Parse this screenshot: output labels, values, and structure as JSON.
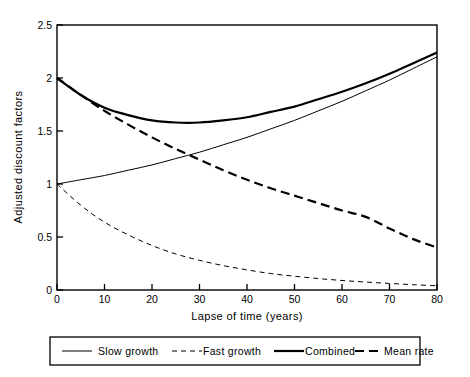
{
  "chart_data": {
    "type": "line",
    "title": "",
    "xlabel": "Lapse of time (years)",
    "ylabel": "Adjusted discount factors",
    "xlim": [
      0,
      80
    ],
    "ylim": [
      0,
      2.5
    ],
    "xticks": [
      0,
      10,
      20,
      30,
      40,
      50,
      60,
      70,
      80
    ],
    "xticklabels": [
      "0",
      "10",
      "20",
      "30",
      "40",
      "50",
      "60",
      "70",
      "80"
    ],
    "yticks": [
      0,
      0.5,
      1,
      1.5,
      2,
      2.5
    ],
    "yticklabels": [
      "0",
      "0.5",
      "1",
      "1.5",
      "2",
      "2.5"
    ],
    "grid": false,
    "legend_position": "below-axes",
    "x": [
      0,
      5,
      10,
      15,
      20,
      25,
      30,
      35,
      40,
      45,
      50,
      55,
      60,
      65,
      70,
      75,
      80
    ],
    "series": [
      {
        "name": "Slow growth",
        "style": "thin-solid",
        "color": "#000000",
        "values": [
          1.0,
          1.04,
          1.08,
          1.13,
          1.18,
          1.24,
          1.3,
          1.37,
          1.44,
          1.52,
          1.6,
          1.69,
          1.78,
          1.88,
          1.98,
          2.09,
          2.2
        ]
      },
      {
        "name": "Fast growth",
        "style": "thin-dashed",
        "color": "#000000",
        "values": [
          1.0,
          0.8,
          0.64,
          0.52,
          0.42,
          0.34,
          0.28,
          0.23,
          0.19,
          0.155,
          0.13,
          0.108,
          0.09,
          0.075,
          0.062,
          0.05,
          0.04
        ]
      },
      {
        "name": "Combined",
        "style": "thick-solid",
        "color": "#000000",
        "values": [
          2.0,
          1.84,
          1.72,
          1.65,
          1.6,
          1.58,
          1.58,
          1.6,
          1.63,
          1.68,
          1.73,
          1.8,
          1.87,
          1.95,
          2.04,
          2.14,
          2.24
        ]
      },
      {
        "name": "Mean rate",
        "style": "thick-dashed",
        "color": "#000000",
        "values": [
          2.0,
          1.84,
          1.69,
          1.56,
          1.44,
          1.33,
          1.23,
          1.13,
          1.04,
          0.96,
          0.89,
          0.82,
          0.75,
          0.69,
          0.58,
          0.48,
          0.4
        ]
      }
    ],
    "legend": [
      {
        "label": "Slow growth",
        "style": "thin-solid"
      },
      {
        "label": "Fast growth",
        "style": "thin-dashed"
      },
      {
        "label": "Combined",
        "style": "thick-solid"
      },
      {
        "label": "Mean rate",
        "style": "thick-dashed"
      }
    ]
  }
}
